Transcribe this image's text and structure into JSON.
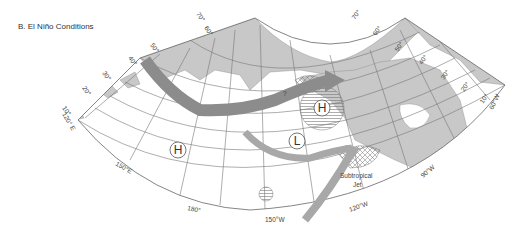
{
  "title": "B. El Niño Conditions",
  "latitude_labels_left": [
    "10°",
    "20°",
    "30°",
    "40°",
    "50°",
    "60°",
    "70°"
  ],
  "latitude_labels_right": [
    "70°",
    "60°",
    "50°",
    "40°",
    "30°",
    "20°",
    "10°"
  ],
  "longitude_labels": {
    "left_corner": "120° E",
    "lon_150e": "150°E",
    "lon_180": "180°",
    "lon_150w": "150°W",
    "lon_120w": "120°W",
    "lon_90w": "90°W",
    "right_corner": "60°W"
  },
  "pressure_systems": [
    {
      "type": "high",
      "label": "H",
      "location": "central North Pacific"
    },
    {
      "type": "high",
      "label": "H",
      "location": "western Canada",
      "hatched": true
    },
    {
      "type": "low",
      "label": "L",
      "location": "Gulf of Alaska / NE Pacific"
    }
  ],
  "annotations": {
    "question_mark": "?",
    "jet_label_line1": "Subtropical",
    "jet_label_line2": "Jet"
  },
  "colors": {
    "land": "#c8c8c8",
    "jet_stream_polar": "#8c8c8c",
    "jet_stream_subtropical": "#a8a8a8",
    "grid": "#777777"
  }
}
